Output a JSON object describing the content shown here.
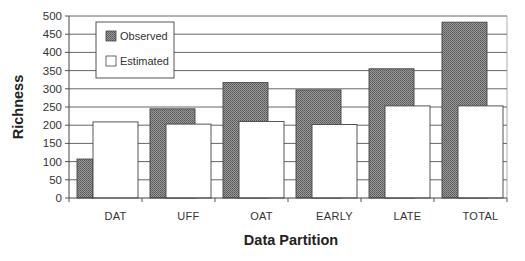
{
  "chart_data": {
    "type": "bar",
    "title": "",
    "xlabel": "Data Partition",
    "ylabel": "Richness",
    "ylim": [
      0,
      500
    ],
    "yticks": [
      0,
      50,
      100,
      150,
      200,
      250,
      300,
      350,
      400,
      450,
      500
    ],
    "grid": true,
    "legend_position": "upper-left (inside)",
    "categories": [
      "DAT",
      "UFF",
      "OAT",
      "EARLY",
      "LATE",
      "TOTAL"
    ],
    "series": [
      {
        "name": "Observed",
        "values": [
          107,
          245,
          317,
          297,
          355,
          483
        ],
        "fill": "hatched-dark-gray"
      },
      {
        "name": "Estimated",
        "values": [
          209,
          203,
          210,
          202,
          253,
          253
        ],
        "fill": "white"
      }
    ]
  },
  "colors": {
    "observed_fill": "#8a8a8a",
    "observed_dot": "#5a5a5a",
    "estimated_fill": "#ffffff",
    "bar_stroke": "#444444",
    "grid": "#555555",
    "axis": "#444444"
  },
  "legend": {
    "items": [
      {
        "label": "Observed"
      },
      {
        "label": "Estimated"
      }
    ]
  }
}
